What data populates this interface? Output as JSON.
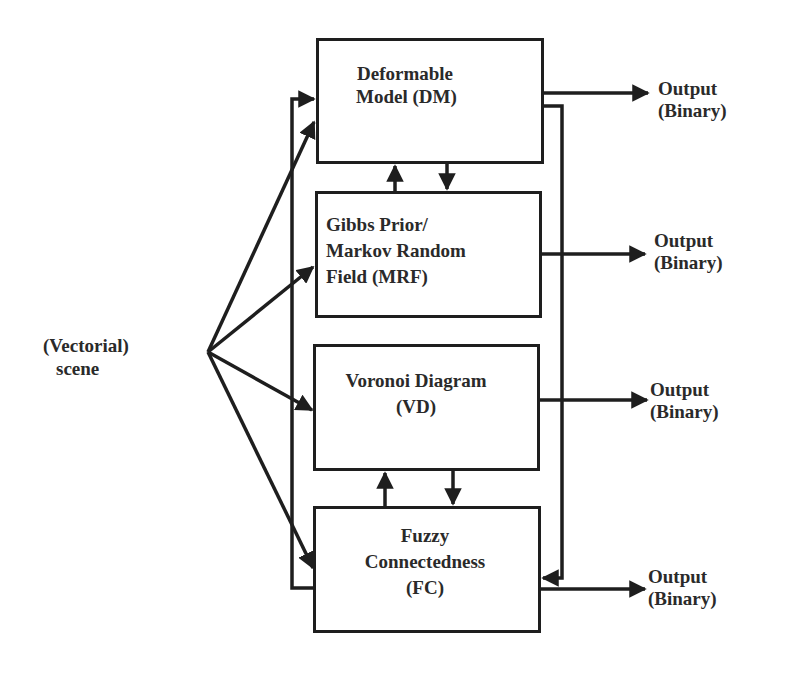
{
  "diagram": {
    "input": {
      "line1": "(Vectorial)",
      "line2": "scene"
    },
    "modules": [
      {
        "id": "dm",
        "lines": [
          "Deformable",
          "Model (DM)"
        ]
      },
      {
        "id": "mrf",
        "lines": [
          "Gibbs Prior/",
          "Markov Random",
          "Field (MRF)"
        ]
      },
      {
        "id": "vd",
        "lines": [
          "Voronoi Diagram",
          "(VD)"
        ]
      },
      {
        "id": "fc",
        "lines": [
          "Fuzzy",
          "Connectedness",
          "(FC)"
        ]
      }
    ],
    "outputs": [
      {
        "line1": "Output",
        "line2": "(Binary)"
      },
      {
        "line1": "Output",
        "line2": "(Binary)"
      },
      {
        "line1": "Output",
        "line2": "(Binary)"
      },
      {
        "line1": "Output",
        "line2": "(Binary)"
      }
    ],
    "colors": {
      "stroke": "#1e1e1e",
      "text": "#2a2a2a",
      "background": "#ffffff"
    }
  }
}
